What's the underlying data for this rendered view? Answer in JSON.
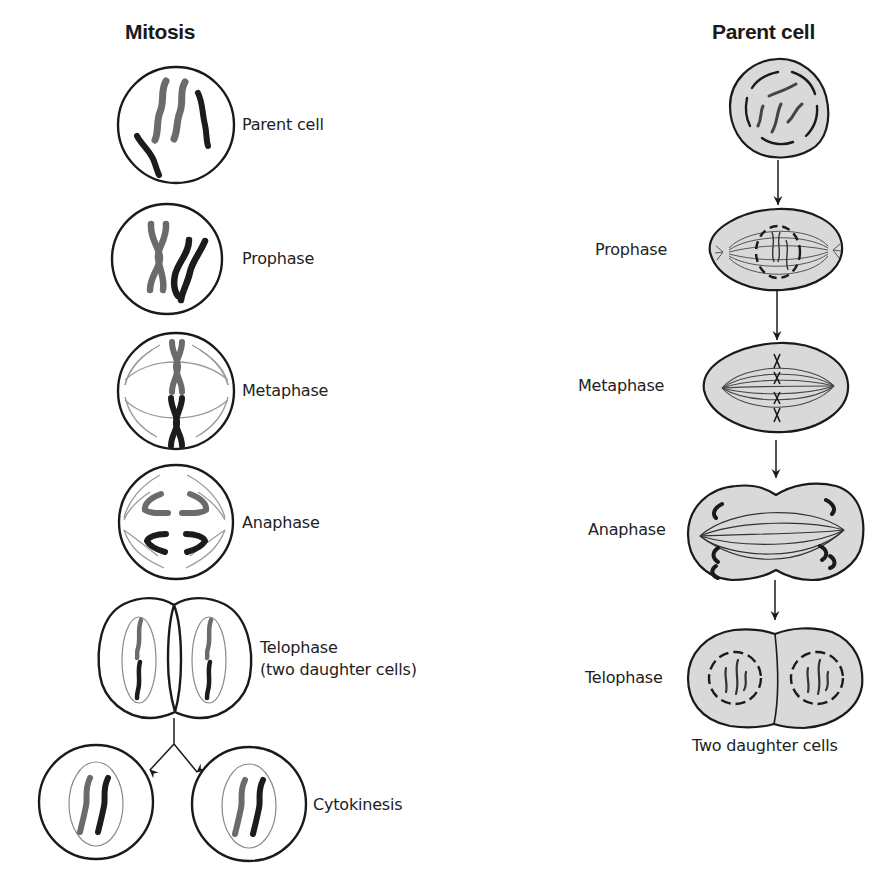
{
  "figure": {
    "caption_cropped": "...ng ... ...y ...g..."
  },
  "left_panel": {
    "title": "Mitosis",
    "stages": [
      {
        "label": "Parent cell"
      },
      {
        "label": "Prophase"
      },
      {
        "label": "Metaphase"
      },
      {
        "label": "Anaphase"
      },
      {
        "label": "Telophase",
        "label_line2": "(two daughter cells)"
      },
      {
        "label": "Cytokinesis"
      }
    ]
  },
  "right_panel": {
    "title": "Parent cell",
    "stages": [
      {
        "label": "Prophase"
      },
      {
        "label": "Metaphase"
      },
      {
        "label": "Anaphase"
      },
      {
        "label": "Telophase"
      }
    ],
    "footer_label": "Two daughter cells"
  },
  "colors": {
    "outline": "#1a1a1a",
    "chromatid_gray": "#6b6b6b",
    "chromatid_dark": "#1c1c1c",
    "spindle": "#9a9a9a",
    "cytoplasm_fill": "#d9d9d9"
  }
}
